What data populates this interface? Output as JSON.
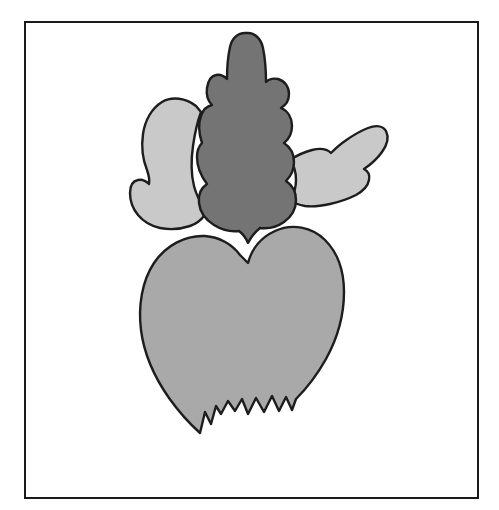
{
  "document": {
    "title": "Beet / Radish line illustration",
    "background_color": "#ffffff",
    "width": 499,
    "height": 510
  },
  "frame": {
    "name": "illustration-border",
    "stroke_color": "#1a1a1a",
    "stroke_width": 2,
    "x": 24,
    "y": 21,
    "width": 455,
    "height": 478,
    "fill": "#ffffff"
  },
  "illustration": {
    "subject": "beet",
    "outline_color": "#1d1d1d",
    "outline_width": 2.4,
    "parts": [
      {
        "id": "leaf-left",
        "label": "Left side leaf",
        "fill": "#c9c9c9"
      },
      {
        "id": "leaf-right",
        "label": "Right side leaf",
        "fill": "#c9c9c9"
      },
      {
        "id": "leaf-center",
        "label": "Center oak-shaped leaf",
        "fill": "#747474"
      },
      {
        "id": "bulb",
        "label": "Heart-shaped beet bulb with torn root tip",
        "fill": "#a9a9a9"
      }
    ]
  },
  "palette": {
    "paper": "#ffffff",
    "ink": "#1d1d1d",
    "leaf_light": "#c9c9c9",
    "leaf_dark": "#747474",
    "bulb": "#a9a9a9"
  }
}
